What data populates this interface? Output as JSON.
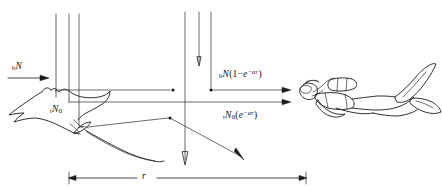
{
  "figure": {
    "caption": "",
    "background_color": "#ffffff",
    "ink_color": "#1a1a1a"
  },
  "subjects": {
    "left": {
      "name": "manta-ray",
      "label": "manta ray silhouette"
    },
    "right": {
      "name": "scuba-diver",
      "label": "scuba diver silhouette"
    }
  },
  "labels": {
    "incident_beam": {
      "base": "b",
      "main": "N",
      "full_text": "bN"
    },
    "path_radiance": {
      "base": "b",
      "main": "N",
      "open_paren": "(",
      "one": "1",
      "minus": "−",
      "e": "e",
      "exponent": "−αr",
      "close_paren": ")",
      "full_text": "bN(1 − e^-ar)"
    },
    "target_radiance": {
      "base": "t",
      "main": "N",
      "subzero": "0",
      "full_text": "tN0"
    },
    "attenuated_radiance": {
      "base": "t",
      "main": "N",
      "subzero": "0",
      "open_paren": "(",
      "e": "e",
      "exponent": "−αr",
      "close_paren": ")",
      "full_text": "tN0(e^-ar)"
    },
    "distance": {
      "symbol": "r",
      "full_text": "r"
    }
  },
  "geometry": {
    "downwelling_rays_left": [
      {
        "x": 56,
        "y_top": 14,
        "y_bottom": 92
      },
      {
        "x": 69,
        "y_top": 14,
        "y_bottom": 99
      },
      {
        "x": 79,
        "y_top": 14,
        "y_bottom": 127
      }
    ],
    "downwelling_rays_mid": [
      {
        "x": 185,
        "y_top": 12,
        "y_bottom": 165
      },
      {
        "x": 199,
        "y_top": 12,
        "y_bottom": 66
      },
      {
        "x": 211,
        "y_top": 12,
        "y_bottom": 90
      }
    ],
    "horizontal_arrows": [
      {
        "name": "incident",
        "x1": 8,
        "x2": 46,
        "y": 78
      },
      {
        "name": "path-radiance",
        "x1": 211,
        "x2": 290,
        "y": 90
      },
      {
        "name": "target-radiance",
        "x1": 56,
        "x2": 176,
        "y": 90
      },
      {
        "name": "attenuated",
        "x1": 69,
        "x2": 290,
        "y": 102
      }
    ],
    "scatter_arrow": {
      "x1": 88,
      "y1": 126,
      "x2": 245,
      "y2": 159
    },
    "dimension_line": {
      "x1": 70,
      "x2": 305,
      "y": 178
    }
  }
}
